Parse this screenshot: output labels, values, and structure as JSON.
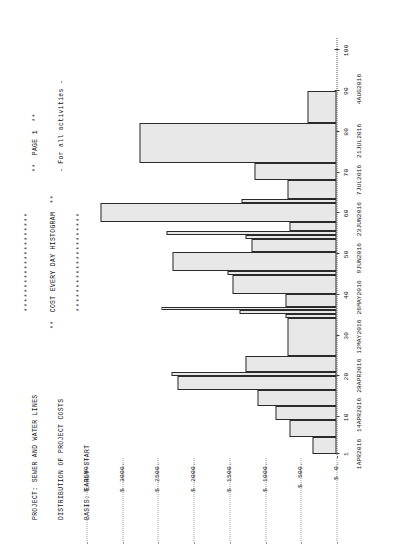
{
  "report": {
    "header_left_lines": [
      "PROJECT: SEWER AND WATER LINES",
      "DISTRIBUTION OF PROJECT COSTS",
      "BASIS: EARLY START"
    ],
    "header_center_lines": [
      "*********************",
      "**  COST EVERY DAY HISTOGRAM  **",
      "*********************"
    ],
    "header_right_lines": [
      "**  PAGE 1  **",
      "- For all activities -"
    ]
  },
  "chart_data": {
    "type": "bar",
    "title": "**  COST EVERY DAY HISTOGRAM  **",
    "subtitle": "DISTRIBUTION OF PROJECT COSTS",
    "xlabel": "",
    "ylabel": "",
    "grid": false,
    "legend": null,
    "ylim": [
      0,
      3750
    ],
    "xlim": [
      0,
      103
    ],
    "y_ticks": [
      0,
      500,
      1000,
      1500,
      2000,
      2500,
      3000,
      3500
    ],
    "y_tick_labels": [
      "0.",
      "500.",
      "1000.",
      "1500.",
      "2000.",
      "2500.",
      "3000.",
      "3500."
    ],
    "y_currency_symbol": "$",
    "x_ticks": [
      1,
      10,
      20,
      30,
      40,
      50,
      60,
      70,
      80,
      90,
      100
    ],
    "x_tick_labels": [
      "1",
      "10",
      "20",
      "30",
      "40",
      "50",
      "60",
      "70",
      "80",
      "90",
      "100"
    ],
    "x_date_ticks": [
      1,
      14,
      28,
      42,
      56,
      70,
      84,
      98,
      112,
      126
    ],
    "x_date_labels": [
      "1APR2016",
      "14APR2016",
      "28APR2016",
      "12MAY2016",
      "26MAY2016",
      "9JUN2016",
      "23JUN2016",
      "7JUL2016",
      "21JUL2016",
      "4AUG2016"
    ],
    "x_date_positions": [
      1,
      10.6,
      20.2,
      29.8,
      39.4,
      49.0,
      58.6,
      68.2,
      77.8,
      90.5
    ],
    "bars": [
      {
        "x": 1,
        "width": 4.1,
        "value": 330
      },
      {
        "x": 5.1,
        "width": 4.3,
        "value": 660
      },
      {
        "x": 9.4,
        "width": 3.3,
        "value": 860
      },
      {
        "x": 12.7,
        "width": 4.0,
        "value": 1100
      },
      {
        "x": 16.7,
        "width": 3.5,
        "value": 2230
      },
      {
        "x": 20.2,
        "width": 0.9,
        "value": 2310
      },
      {
        "x": 21.1,
        "width": 3.9,
        "value": 1270
      },
      {
        "x": 25.0,
        "width": 9.3,
        "value": 690
      },
      {
        "x": 34.3,
        "width": 0.9,
        "value": 720
      },
      {
        "x": 35.2,
        "width": 1.1,
        "value": 1360
      },
      {
        "x": 36.3,
        "width": 0.8,
        "value": 2450
      },
      {
        "x": 37.1,
        "width": 3.1,
        "value": 710
      },
      {
        "x": 40.2,
        "width": 4.7,
        "value": 1450
      },
      {
        "x": 44.9,
        "width": 0.9,
        "value": 1520
      },
      {
        "x": 45.8,
        "width": 4.6,
        "value": 2290
      },
      {
        "x": 50.4,
        "width": 3.3,
        "value": 1190
      },
      {
        "x": 53.7,
        "width": 0.9,
        "value": 1280
      },
      {
        "x": 54.6,
        "width": 1.0,
        "value": 2380
      },
      {
        "x": 55.6,
        "width": 2.3,
        "value": 660
      },
      {
        "x": 57.9,
        "width": 4.6,
        "value": 3300
      },
      {
        "x": 62.5,
        "width": 1.0,
        "value": 1330
      },
      {
        "x": 63.5,
        "width": 4.6,
        "value": 680
      },
      {
        "x": 68.1,
        "width": 4.3,
        "value": 1150
      },
      {
        "x": 72.4,
        "width": 9.8,
        "value": 2760
      },
      {
        "x": 82.2,
        "width": 7.9,
        "value": 400
      }
    ]
  }
}
